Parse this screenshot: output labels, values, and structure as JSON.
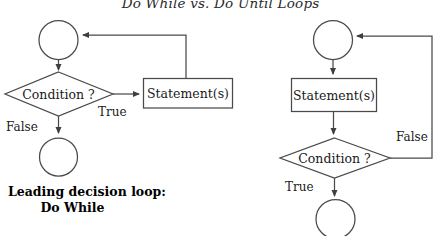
{
  "title": "Do While vs. Do Until Loops",
  "colors": {
    "stroke": "#4a4a4a",
    "text": "#1a1a1a",
    "background": "#ffffff"
  },
  "left_diagram": {
    "caption_line1": "Leading decision loop:",
    "caption_line2": "Do While",
    "start_node": "",
    "decision": "Condition ?",
    "process": "Statement(s)",
    "end_node": "",
    "branch_true": "True",
    "branch_false": "False"
  },
  "right_diagram": {
    "start_node": "",
    "process": "Statement(s)",
    "decision": "Condition ?",
    "end_node": "",
    "branch_true": "True",
    "branch_false": "False"
  }
}
